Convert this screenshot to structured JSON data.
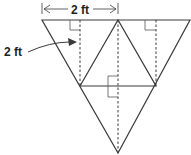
{
  "labels": {
    "top_dimension": "2 ft",
    "side_label": "2 ft"
  },
  "colors": {
    "stroke": "#3a3a3a",
    "text": "#231f20",
    "right_angle": "#555555"
  }
}
